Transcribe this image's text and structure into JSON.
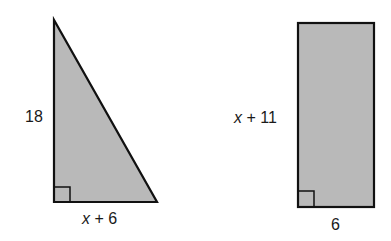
{
  "colors": {
    "fill": "#b9b9b9",
    "stroke": "#111111",
    "background": "#ffffff"
  },
  "triangle": {
    "type": "right-triangle",
    "side_label": "18",
    "base_label": {
      "var": "x",
      "rest": " + 6"
    },
    "right_angle_marker": true
  },
  "rectangle": {
    "type": "rectangle",
    "side_label": {
      "var": "x",
      "rest": " + 11"
    },
    "base_label": "6",
    "right_angle_marker": true
  }
}
